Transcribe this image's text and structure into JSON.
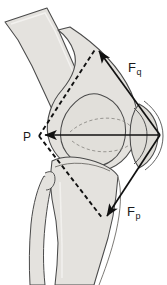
{
  "figure": {
    "name": "knee-joint-force-diagram",
    "view": "lateral view of flexed knee",
    "background_color": "#ffffff",
    "bone_fill_color": "#e4e2de",
    "bone_outline_color": "#4a4a4a",
    "vector_color": "#111111",
    "width": 167,
    "height": 285
  },
  "labels": {
    "quadriceps_force": {
      "base": "F",
      "sub": "q"
    },
    "patellar_force": {
      "base": "F",
      "sub": "p"
    },
    "resultant_force": {
      "base": "P",
      "sub": ""
    }
  },
  "vectors": [
    {
      "id": "fq",
      "label": "F_q",
      "description": "quadriceps tendon force, arrow pointing up and to the left",
      "from": [
        160,
        135
      ],
      "to": [
        96,
        47
      ],
      "arrowhead": "to",
      "style": "solid"
    },
    {
      "id": "fp",
      "label": "F_p",
      "description": "patellar tendon force, arrow pointing down and to the left",
      "from": [
        160,
        135
      ],
      "to": [
        104,
        220
      ],
      "arrowhead": "to",
      "style": "solid"
    },
    {
      "id": "p",
      "label": "P",
      "description": "resultant patellofemoral joint reaction force, horizontal arrow pointing left",
      "from": [
        160,
        135
      ],
      "to": [
        41,
        135
      ],
      "arrowhead": "to",
      "style": "solid"
    }
  ],
  "construction_lines": [
    {
      "id": "dash-upper",
      "description": "dashed parallelogram side from resultant tip up-right to quadriceps arrow tip",
      "from": [
        39,
        136
      ],
      "to": [
        96,
        48
      ],
      "style": "dashed"
    },
    {
      "id": "dash-lower",
      "description": "dashed parallelogram side from resultant tip down-right to patellar arrow tip",
      "from": [
        39,
        136
      ],
      "to": [
        103,
        219
      ],
      "style": "dashed"
    }
  ],
  "anatomy": [
    {
      "id": "femur",
      "name": "femur",
      "description": "diagonal shaft descending from upper left to the condyle"
    },
    {
      "id": "condyle",
      "name": "femoral-condyle",
      "description": "rounded distal femoral condyle at the joint centre"
    },
    {
      "id": "patella",
      "name": "patella",
      "description": "lens-shaped bone at the right of the joint"
    },
    {
      "id": "tibia",
      "name": "tibia",
      "description": "broad shaft descending below the joint"
    },
    {
      "id": "fibula",
      "name": "fibula",
      "description": "narrow bone lateral (left) of the tibia"
    }
  ]
}
